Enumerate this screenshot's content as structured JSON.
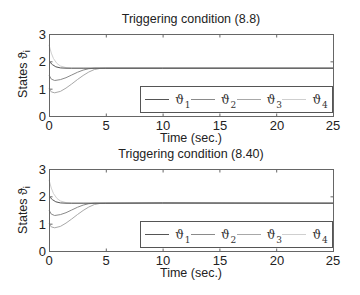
{
  "chart_data": [
    {
      "type": "line",
      "title": "Triggering condition (8.8)",
      "xlabel": "Time (sec.)",
      "ylabel": "States ϑ_i",
      "xlim": [
        0,
        25
      ],
      "ylim": [
        0,
        3
      ],
      "xticks": [
        0,
        5,
        10,
        15,
        20,
        25
      ],
      "yticks": [
        0,
        1,
        2,
        3
      ],
      "grid": false,
      "legend_position": "lower right, horizontal",
      "series": [
        {
          "name": "ϑ1",
          "color": "#555555",
          "x": [
            0,
            0.3,
            0.6,
            1.0,
            1.5,
            2,
            3,
            5,
            10,
            25
          ],
          "y": [
            2.0,
            1.88,
            1.8,
            1.76,
            1.75,
            1.75,
            1.75,
            1.75,
            1.75,
            1.75
          ]
        },
        {
          "name": "ϑ2",
          "color": "#8a8a8a",
          "x": [
            0,
            0.2,
            0.5,
            1.0,
            1.5,
            2,
            2.5,
            3,
            3.5,
            4,
            5,
            10,
            25
          ],
          "y": [
            1.5,
            1.35,
            1.3,
            1.33,
            1.4,
            1.5,
            1.6,
            1.68,
            1.73,
            1.75,
            1.75,
            1.75,
            1.75
          ]
        },
        {
          "name": "ϑ3",
          "color": "#a8a8a8",
          "x": [
            0,
            0.2,
            0.5,
            1.0,
            1.5,
            2,
            2.5,
            3,
            3.5,
            4,
            4.5,
            5,
            10,
            25
          ],
          "y": [
            1.0,
            0.88,
            0.85,
            0.9,
            1.02,
            1.17,
            1.33,
            1.48,
            1.61,
            1.7,
            1.74,
            1.75,
            1.75,
            1.75
          ]
        },
        {
          "name": "ϑ4",
          "color": "#cfcfcf",
          "x": [
            0,
            0.2,
            0.4,
            0.7,
            1.0,
            1.5,
            2,
            3,
            5,
            10,
            25
          ],
          "y": [
            2.6,
            2.3,
            2.1,
            1.92,
            1.83,
            1.77,
            1.75,
            1.75,
            1.75,
            1.75,
            1.75
          ]
        }
      ]
    },
    {
      "type": "line",
      "title": "Triggering condition (8.40)",
      "xlabel": "Time (sec.)",
      "ylabel": "States ϑ_i",
      "xlim": [
        0,
        25
      ],
      "ylim": [
        0,
        3
      ],
      "xticks": [
        0,
        5,
        10,
        15,
        20,
        25
      ],
      "yticks": [
        0,
        1,
        2,
        3
      ],
      "grid": false,
      "legend_position": "lower right, horizontal",
      "series": [
        {
          "name": "ϑ1",
          "color": "#555555",
          "x": [
            0,
            0.3,
            0.6,
            1.0,
            1.5,
            2,
            3,
            5,
            10,
            25
          ],
          "y": [
            2.0,
            1.88,
            1.8,
            1.76,
            1.75,
            1.75,
            1.75,
            1.75,
            1.76,
            1.75
          ]
        },
        {
          "name": "ϑ2",
          "color": "#8a8a8a",
          "x": [
            0,
            0.2,
            0.5,
            1.0,
            1.5,
            2,
            2.5,
            3,
            3.5,
            4,
            5,
            10,
            25
          ],
          "y": [
            1.5,
            1.35,
            1.3,
            1.33,
            1.4,
            1.5,
            1.6,
            1.68,
            1.73,
            1.75,
            1.75,
            1.75,
            1.75
          ]
        },
        {
          "name": "ϑ3",
          "color": "#a8a8a8",
          "x": [
            0,
            0.2,
            0.5,
            1.0,
            1.5,
            2,
            2.5,
            3,
            3.5,
            4,
            4.5,
            5,
            10,
            25
          ],
          "y": [
            1.0,
            0.88,
            0.85,
            0.9,
            1.02,
            1.17,
            1.33,
            1.48,
            1.61,
            1.7,
            1.74,
            1.75,
            1.75,
            1.75
          ]
        },
        {
          "name": "ϑ4",
          "color": "#cfcfcf",
          "x": [
            0,
            0.2,
            0.4,
            0.7,
            1.0,
            1.5,
            2,
            3,
            5,
            10,
            25
          ],
          "y": [
            2.6,
            2.3,
            2.1,
            1.92,
            1.83,
            1.77,
            1.75,
            1.75,
            1.75,
            1.75,
            1.75
          ]
        }
      ]
    }
  ],
  "panels": [
    {
      "title": "Triggering condition (8.8)",
      "xlabel": "Time (sec.)",
      "ylabel": "States ϑ",
      "ylabel_sub": "i",
      "xtick_labels": [
        "0",
        "5",
        "10",
        "15",
        "20",
        "25"
      ],
      "ytick_labels": [
        "0",
        "1",
        "2",
        "3"
      ],
      "legend": [
        {
          "symbol": "ϑ",
          "sub": "1"
        },
        {
          "symbol": "ϑ",
          "sub": "2"
        },
        {
          "symbol": "ϑ",
          "sub": "3"
        },
        {
          "symbol": "ϑ",
          "sub": "4"
        }
      ]
    },
    {
      "title": "Triggering condition (8.40)",
      "xlabel": "Time (sec.)",
      "ylabel": "States ϑ",
      "ylabel_sub": "i",
      "xtick_labels": [
        "0",
        "5",
        "10",
        "15",
        "20",
        "25"
      ],
      "ytick_labels": [
        "0",
        "1",
        "2",
        "3"
      ],
      "legend": [
        {
          "symbol": "ϑ",
          "sub": "1"
        },
        {
          "symbol": "ϑ",
          "sub": "2"
        },
        {
          "symbol": "ϑ",
          "sub": "3"
        },
        {
          "symbol": "ϑ",
          "sub": "4"
        }
      ]
    }
  ],
  "colors": {
    "axis": "#666666",
    "series": [
      "#555555",
      "#8a8a8a",
      "#a8a8a8",
      "#cfcfcf"
    ]
  }
}
